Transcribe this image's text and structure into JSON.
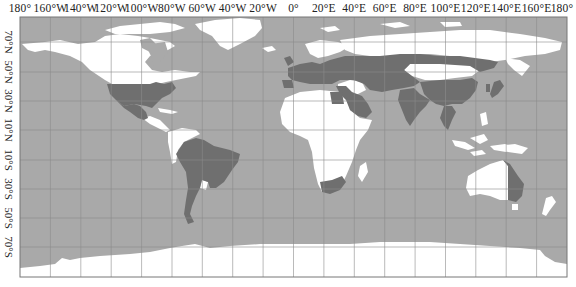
{
  "map": {
    "projection": "equirectangular",
    "colors": {
      "ocean": "#a9a9a9",
      "land": "#ffffff",
      "highlighted": "#6f6f6f",
      "grid": "#8c8c8c",
      "frame": "#777777"
    },
    "longitude_labels": [
      "180°",
      "160°W",
      "140°W",
      "120°W",
      "100°W",
      "80°W",
      "60°W",
      "40°W",
      "20°W",
      "0°",
      "20°E",
      "40°E",
      "60°E",
      "80°E",
      "100°E",
      "120°E",
      "140°E",
      "160°E",
      "180°"
    ],
    "latitude_labels": [
      "70°N",
      "50°N",
      "30°N",
      "10°N",
      "10°S",
      "30°S",
      "50°S",
      "70°S"
    ],
    "highlighted_regions": [
      "United States",
      "Mexico",
      "Brazil",
      "Argentina",
      "Paraguay",
      "Uruguay",
      "Europe",
      "Russia",
      "Kazakhstan",
      "Central Asia",
      "Middle East",
      "Egypt",
      "Saudi Arabia",
      "India",
      "China",
      "Southeast Asia",
      "Japan",
      "South Africa",
      "Eastern Australia"
    ]
  }
}
